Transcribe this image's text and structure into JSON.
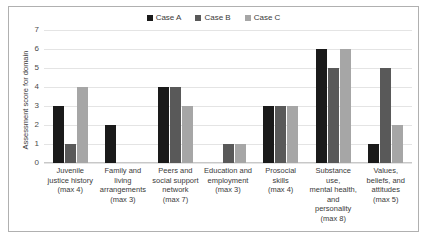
{
  "chart_data": {
    "type": "bar",
    "title": "",
    "xlabel": "",
    "ylabel": "Assessment score for domain",
    "ylim": [
      0,
      7
    ],
    "yticks": [
      0,
      1,
      2,
      3,
      4,
      5,
      6,
      7
    ],
    "grid": true,
    "legend_position": "top-center",
    "categories": [
      "Juvenile justice history (max 4)",
      "Family and living arrangements (max 3)",
      "Peers and social support network (max 7)",
      "Education and employment (max 3)",
      "Prosocial skills (max 4)",
      "Substance use, mental health, and personality (max 8)",
      "Values, beliefs, and attitudes (max 5)"
    ],
    "category_lines": [
      [
        "Juvenile",
        "justice history",
        "(max 4)"
      ],
      [
        "Family and",
        "living",
        "arrangements",
        "(max 3)"
      ],
      [
        "Peers and",
        "social support",
        "network",
        "(max 7)"
      ],
      [
        "Education and",
        "employment",
        "(max 3)"
      ],
      [
        "Prosocial",
        "skills",
        "(max 4)"
      ],
      [
        "Substance use,",
        "mental health,",
        "and",
        "personality",
        "(max 8)"
      ],
      [
        "Values,",
        "beliefs, and",
        "attitudes",
        "(max 5)"
      ]
    ],
    "series": [
      {
        "name": "Case A",
        "color": "#1a1a1a",
        "values": [
          3,
          2,
          4,
          0,
          3,
          6,
          1
        ]
      },
      {
        "name": "Case B",
        "color": "#595959",
        "values": [
          1,
          0,
          4,
          1,
          3,
          5,
          5
        ]
      },
      {
        "name": "Case C",
        "color": "#a6a6a6",
        "values": [
          4,
          0,
          3,
          1,
          3,
          6,
          2
        ]
      }
    ]
  },
  "legend": {
    "entries": [
      {
        "label": "Case A",
        "color": "#1a1a1a"
      },
      {
        "label": "Case B",
        "color": "#595959"
      },
      {
        "label": "Case C",
        "color": "#a6a6a6"
      }
    ]
  },
  "axis": {
    "y_title": "Assessment score for domain"
  }
}
